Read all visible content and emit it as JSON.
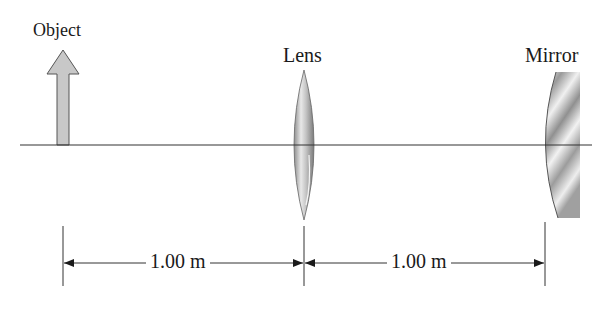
{
  "diagram": {
    "type": "optics-setup",
    "labels": {
      "object": "Object",
      "lens": "Lens",
      "mirror": "Mirror"
    },
    "dimensions": [
      {
        "from": "object",
        "to": "lens",
        "label": "1.00 m"
      },
      {
        "from": "lens",
        "to": "mirror",
        "label": "1.00 m"
      }
    ],
    "colors": {
      "line": "#333333",
      "object_fill": "#c8c8c8",
      "lens_fill": "#b5b5b5",
      "mirror_fill": "#a8a8a8"
    }
  }
}
